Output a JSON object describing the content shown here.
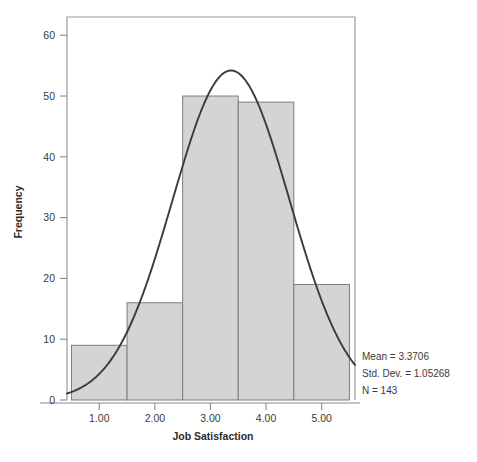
{
  "chart_data": {
    "type": "bar",
    "title": "",
    "subtitle": "",
    "xlabel": "Job Satisfaction",
    "ylabel": "Frequency",
    "categories": [
      "1.00",
      "2.00",
      "3.00",
      "4.00",
      "5.00"
    ],
    "values": [
      9,
      16,
      50,
      49,
      19
    ],
    "bin_edges": [
      0.5,
      1.5,
      2.5,
      3.5,
      4.5,
      5.5
    ],
    "bin_width": 1.0,
    "xlim": [
      0.42,
      5.6
    ],
    "ylim": [
      0,
      63
    ],
    "x_ticks": [
      "1.00",
      "2.00",
      "3.00",
      "4.00",
      "5.00"
    ],
    "x_tick_values": [
      1,
      2,
      3,
      4,
      5
    ],
    "y_ticks": [
      "0",
      "10",
      "20",
      "30",
      "40",
      "50",
      "60"
    ],
    "y_tick_values": [
      0,
      10,
      20,
      30,
      40,
      50,
      60
    ],
    "grid": false,
    "legend": false,
    "overlay": {
      "type": "normal-curve",
      "mean": 3.3706,
      "std_dev": 1.05268,
      "n": 143,
      "peak_value": 54.2
    },
    "annotations": {
      "mean": "Mean = 3.3706",
      "std_dev": "Std. Dev. = 1.05268",
      "n": "N = 143"
    },
    "colors": {
      "bar_fill": "#d4d4d4",
      "bar_stroke": "#7d7d7d",
      "curve": "#3b3b3b",
      "frame": "#9a9a9a",
      "text": "#3a3a3a",
      "background": "#ffffff"
    }
  },
  "axes": {
    "x_title": "Job Satisfaction",
    "y_title": "Frequency"
  }
}
